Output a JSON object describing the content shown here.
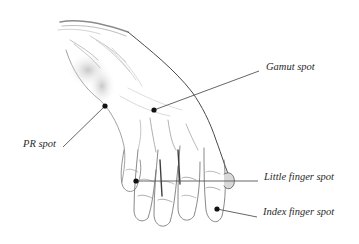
{
  "figure": {
    "line_color": "#555555",
    "dot_color": "#111111"
  },
  "labels": {
    "pr_spot": "PR spot",
    "gamut_spot": "Gamut spot",
    "little_finger_spot": "Little finger spot",
    "index_finger_spot": "Index finger spot"
  },
  "spots": [
    {
      "name": "PR spot",
      "dot": [
        105,
        106
      ],
      "line_end": [
        63,
        147
      ]
    },
    {
      "name": "Gamut spot",
      "dot": [
        154,
        110
      ],
      "line_end": [
        259,
        71
      ]
    },
    {
      "name": "Little finger spot",
      "dot": [
        136,
        181
      ],
      "line_end": [
        258,
        181
      ]
    },
    {
      "name": "Index finger spot",
      "dot": [
        217,
        209
      ],
      "line_end": [
        257,
        217
      ]
    }
  ]
}
